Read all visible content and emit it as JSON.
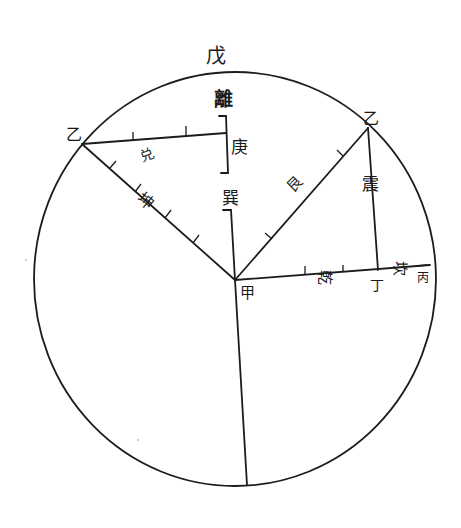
{
  "diagram": {
    "type": "geometric-construction",
    "circle": {
      "cx": 235,
      "cy": 279,
      "rx": 201,
      "ry": 207
    },
    "labels": {
      "top": "戊",
      "li": "離",
      "geng": "庚",
      "xun": "巽",
      "left_vertex": "乙",
      "right_vertex": "乙",
      "kun": "坤",
      "dui": "兑",
      "center": "甲",
      "gen": "艮",
      "zhen": "震",
      "qian": "乾",
      "ding": "丁",
      "kan": "坎",
      "bing": "丙"
    }
  }
}
